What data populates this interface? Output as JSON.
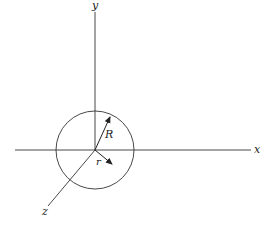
{
  "diagram": {
    "type": "3d-coordinate-axes-with-sphere",
    "colors": {
      "stroke": "#333333",
      "background": "#ffffff"
    },
    "axes": {
      "x": {
        "label": "x"
      },
      "y": {
        "label": "y"
      },
      "z": {
        "label": "z"
      }
    },
    "sphere": {
      "radius_label": "R"
    },
    "vectors": [
      {
        "label": "R",
        "description": "radius vector to sphere surface"
      },
      {
        "label": "r",
        "description": "position vector inside sphere"
      }
    ]
  }
}
